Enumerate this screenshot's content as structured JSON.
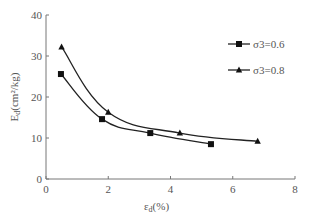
{
  "chart_data": {
    "type": "line",
    "title": "",
    "xlabel": "ε",
    "xlabel_sub": "d",
    "xlabel_unit": "(%)",
    "ylabel": "E",
    "ylabel_sub": "d",
    "ylabel_unit": "(cm²/kg)",
    "xlim": [
      0,
      8
    ],
    "ylim": [
      0,
      40
    ],
    "xticks": [
      "0",
      "2",
      "4",
      "6",
      "8"
    ],
    "yticks": [
      "0",
      "10",
      "20",
      "30",
      "40"
    ],
    "grid": false,
    "legend_position": "top-right",
    "smooth": true,
    "series": [
      {
        "name": "σ3=0.6",
        "marker": "square",
        "x": [
          0.48,
          1.8,
          3.35,
          5.3
        ],
        "y": [
          25.6,
          14.6,
          11.2,
          8.5
        ]
      },
      {
        "name": "σ3=0.8",
        "marker": "triangle",
        "x": [
          0.5,
          2.0,
          4.3,
          6.8
        ],
        "y": [
          32.2,
          16.3,
          11.2,
          9.2
        ]
      }
    ]
  }
}
